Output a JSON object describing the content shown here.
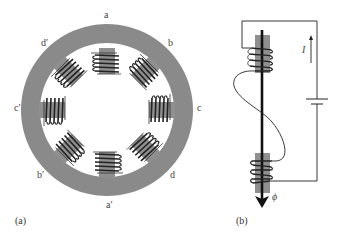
{
  "figure": {
    "panel_a": {
      "label": "(a)",
      "description": "Stator ring with eight salient poles and windings",
      "pole_labels": {
        "a": "a",
        "b": "b",
        "c": "c",
        "d": "d",
        "a_prime": "a′",
        "b_prime": "b′",
        "c_prime": "c′",
        "d_prime": "d′"
      }
    },
    "panel_b": {
      "label": "(b)",
      "description": "Pole pair coils connected in series with battery",
      "current_label": "I",
      "flux_label": "ϕ"
    },
    "colors": {
      "iron": "#8a8a8a",
      "pole": "#8f8f8f",
      "wire": "#222222",
      "text": "#444444",
      "background": "#ffffff"
    }
  }
}
